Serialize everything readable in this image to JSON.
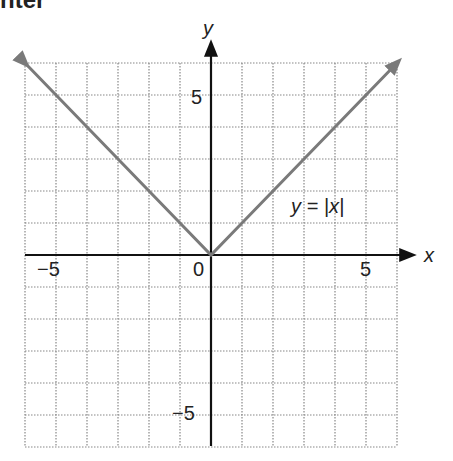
{
  "header_fragment": "nter",
  "chart_data": {
    "type": "line",
    "title": "",
    "xlabel": "x",
    "ylabel": "y",
    "xlim": [
      -6,
      6
    ],
    "ylim": [
      -6,
      6
    ],
    "grid": true,
    "x_ticks": [
      "-5",
      "0",
      "5"
    ],
    "y_ticks": [
      "5",
      "-5"
    ],
    "series": [
      {
        "name": "y = |x|",
        "x": [
          -6,
          -5,
          -4,
          -3,
          -2,
          -1,
          0,
          1,
          2,
          3,
          4,
          5,
          6
        ],
        "y": [
          6,
          5,
          4,
          3,
          2,
          1,
          0,
          1,
          2,
          3,
          4,
          5,
          6
        ],
        "color": "#7a7a7a"
      }
    ],
    "annotations": [
      {
        "text": "y = |x|",
        "x": 3.5,
        "y": 1.5
      }
    ]
  },
  "labels": {
    "x_axis": "x",
    "y_axis": "y",
    "tick_neg5_x": "−5",
    "tick_0": "0",
    "tick_5_x": "5",
    "tick_5_y": "5",
    "tick_neg5_y": "−5",
    "curve": "y = |x|"
  }
}
